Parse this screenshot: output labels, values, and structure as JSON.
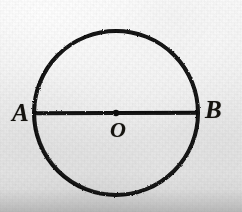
{
  "figure": {
    "kind": "geometry-diagram",
    "background_color": "#e8e8e8",
    "ink_color": "#111111"
  },
  "labels": {
    "point_a": "A",
    "point_b": "B",
    "center_o": "O"
  },
  "chart_data": {
    "type": "diagram",
    "title": "",
    "shapes": [
      {
        "name": "circle",
        "type": "circle",
        "center": [
          116,
          113
        ],
        "radius": 82,
        "stroke": "#111111",
        "stroke_width": 4,
        "fill": "none"
      },
      {
        "name": "diameter-ab",
        "type": "line",
        "from": [
          34,
          113
        ],
        "to": [
          198,
          113
        ],
        "stroke": "#111111",
        "stroke_width": 4
      },
      {
        "name": "center-point",
        "type": "dot",
        "at": [
          116,
          113
        ],
        "radius": 3.2,
        "fill": "#111111"
      }
    ],
    "points": [
      {
        "id": "A",
        "label": "A",
        "at": [
          34,
          113
        ],
        "label_at": [
          22,
          113
        ]
      },
      {
        "id": "O",
        "label": "O",
        "at": [
          116,
          113
        ],
        "label_at": [
          119,
          130
        ]
      },
      {
        "id": "B",
        "label": "B",
        "at": [
          198,
          113
        ],
        "label_at": [
          214,
          110
        ]
      }
    ],
    "annotations": []
  }
}
